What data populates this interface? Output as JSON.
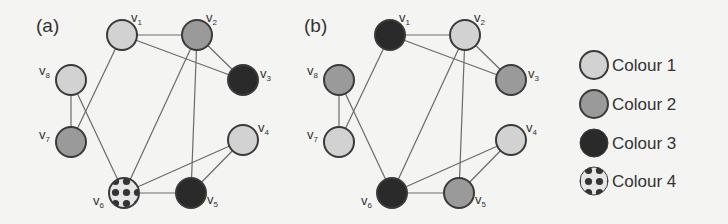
{
  "colors": {
    "colour1": "#d2d2d2",
    "colour2": "#9a9a9a",
    "colour3": "#2a2a2a",
    "colour4_base": "#e6e6e6",
    "colour4_dots": "#333333",
    "edge": "#6a6a6a",
    "stroke": "#3a3a3a",
    "background": "#f4f4f2"
  },
  "legend": {
    "items": [
      {
        "label": "Colour 1",
        "colour": "colour1"
      },
      {
        "label": "Colour 2",
        "colour": "colour2"
      },
      {
        "label": "Colour 3",
        "colour": "colour3"
      },
      {
        "label": "Colour 4",
        "colour": "colour4"
      }
    ]
  },
  "graphs": [
    {
      "label": "(a)",
      "offset_x": 0,
      "colouring": {
        "v1": "colour1",
        "v2": "colour2",
        "v3": "colour3",
        "v4": "colour1",
        "v5": "colour3",
        "v6": "colour4",
        "v7": "colour2",
        "v8": "colour1"
      }
    },
    {
      "label": "(b)",
      "offset_x": 268,
      "colouring": {
        "v1": "colour3",
        "v2": "colour1",
        "v3": "colour2",
        "v4": "colour1",
        "v5": "colour2",
        "v6": "colour3",
        "v7": "colour1",
        "v8": "colour2"
      }
    }
  ],
  "vertices": [
    {
      "id": "v1",
      "name": "v",
      "sub": "1",
      "x": 122,
      "y": 35,
      "lx": 9,
      "ly": -13
    },
    {
      "id": "v2",
      "name": "v",
      "sub": "2",
      "x": 197,
      "y": 35,
      "lx": 9,
      "ly": -13
    },
    {
      "id": "v3",
      "name": "v",
      "sub": "3",
      "x": 243,
      "y": 80,
      "lx": 17,
      "ly": -2
    },
    {
      "id": "v4",
      "name": "v",
      "sub": "4",
      "x": 243,
      "y": 140,
      "lx": 15,
      "ly": -8
    },
    {
      "id": "v5",
      "name": "v",
      "sub": "5",
      "x": 191,
      "y": 193,
      "lx": 16,
      "ly": 11
    },
    {
      "id": "v6",
      "name": "v",
      "sub": "6",
      "x": 124,
      "y": 193,
      "lx": -31,
      "ly": 12
    },
    {
      "id": "v7",
      "name": "v",
      "sub": "7",
      "x": 71,
      "y": 142,
      "lx": -32,
      "ly": -3
    },
    {
      "id": "v8",
      "name": "v",
      "sub": "8",
      "x": 71,
      "y": 80,
      "lx": -32,
      "ly": -5
    }
  ],
  "edges": [
    [
      "v1",
      "v2"
    ],
    [
      "v1",
      "v3"
    ],
    [
      "v1",
      "v7"
    ],
    [
      "v2",
      "v3"
    ],
    [
      "v2",
      "v5"
    ],
    [
      "v2",
      "v6"
    ],
    [
      "v8",
      "v7"
    ],
    [
      "v8",
      "v6"
    ],
    [
      "v6",
      "v5"
    ],
    [
      "v6",
      "v4"
    ],
    [
      "v4",
      "v5"
    ]
  ]
}
